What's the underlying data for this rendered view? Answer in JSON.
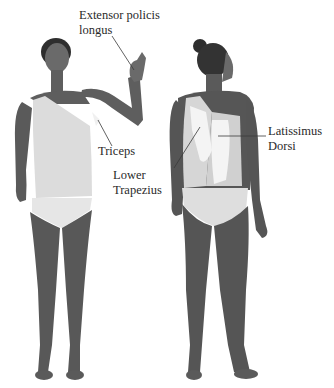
{
  "figure": {
    "views": [
      {
        "id": "front",
        "label": "Front view"
      },
      {
        "id": "back",
        "label": "Back view"
      }
    ],
    "labels": [
      {
        "id": "extensor",
        "lines": [
          "Extensor policis",
          "longus"
        ]
      },
      {
        "id": "triceps",
        "lines": [
          "Triceps"
        ]
      },
      {
        "id": "lower-trapezius",
        "lines": [
          "Lower",
          "Trapezius"
        ]
      },
      {
        "id": "latissimus",
        "lines": [
          "Latissimus",
          "Dorsi"
        ]
      }
    ],
    "colors": {
      "skin": "#5e5e5e",
      "skin_dark": "#4a4a4a",
      "hair": "#2e2e2e",
      "garment": "#d9d9d9",
      "highlight": "#f2f2f2",
      "leader_line": "#3a3a3a",
      "text": "#2a2a2a"
    }
  }
}
